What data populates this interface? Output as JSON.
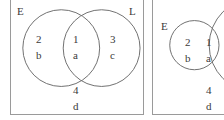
{
  "figure": {
    "background_color": "#ffffff",
    "stroke_color": "#6f6f6f",
    "frame_color": "#9a9a9a",
    "text_color": "#3a3a3a"
  },
  "panels": [
    {
      "id": "panel-1",
      "set_labels": {
        "left": "E",
        "right": "L"
      },
      "regions": [
        {
          "key": "left-only",
          "number": "2",
          "letter": "b"
        },
        {
          "key": "intersection",
          "number": "1",
          "letter": "a"
        },
        {
          "key": "right-only",
          "number": "3",
          "letter": "c"
        },
        {
          "key": "outside",
          "number": "4",
          "letter": "d"
        }
      ]
    },
    {
      "id": "panel-2",
      "set_labels": {
        "left": "E"
      },
      "regions": [
        {
          "key": "left-only",
          "number": "2",
          "letter": "b"
        },
        {
          "key": "intersection",
          "number": "1",
          "letter": "a"
        },
        {
          "key": "outside",
          "number": "4",
          "letter": "d"
        }
      ]
    }
  ]
}
